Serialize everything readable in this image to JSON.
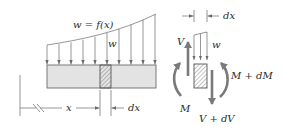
{
  "diagram": {
    "beam": {
      "load_label": "w = f(x)",
      "load_symbol": "w",
      "position_label": "x",
      "element_width_label": "dx"
    },
    "element": {
      "element_width_label": "dx",
      "load_symbol": "w",
      "shear_left": "V",
      "shear_right": "V + dV",
      "moment_left": "M",
      "moment_right": "M + dM"
    },
    "colors": {
      "line": "#7a7a7a",
      "beam_fill": "#e3e3e3",
      "force_arrow": "#7a7a7a",
      "text": "#2a2a2a"
    }
  }
}
